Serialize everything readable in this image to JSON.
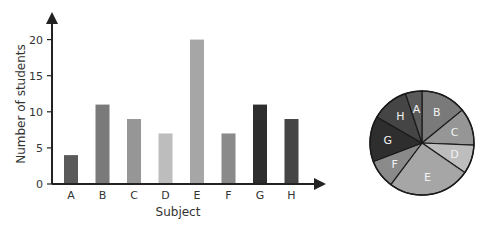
{
  "chart_data": [
    {
      "type": "bar",
      "title": "",
      "xlabel": "Subject",
      "ylabel": "Number of students",
      "categories": [
        "A",
        "B",
        "C",
        "D",
        "E",
        "F",
        "G",
        "H"
      ],
      "values": [
        4,
        11,
        9,
        7,
        20,
        7,
        11,
        9
      ],
      "colors": [
        "#5a5a5a",
        "#7a7a7a",
        "#969696",
        "#bdbdbd",
        "#a6a6a6",
        "#8a8a8a",
        "#2e2e2e",
        "#454545"
      ],
      "yticks": [
        0,
        5,
        10,
        15,
        20
      ],
      "ylim": [
        0,
        22
      ],
      "grid": false,
      "legend": "none"
    },
    {
      "type": "pie",
      "title": "",
      "categories": [
        "B",
        "C",
        "D",
        "E",
        "F",
        "G",
        "H",
        "A"
      ],
      "values": [
        11,
        9,
        7,
        20,
        7,
        11,
        9,
        4
      ],
      "colors": [
        "#7a7a7a",
        "#969696",
        "#bdbdbd",
        "#a6a6a6",
        "#8a8a8a",
        "#2e2e2e",
        "#454545",
        "#5a5a5a"
      ],
      "start_angle": "top",
      "direction": "clockwise",
      "labels_inside": true
    }
  ]
}
